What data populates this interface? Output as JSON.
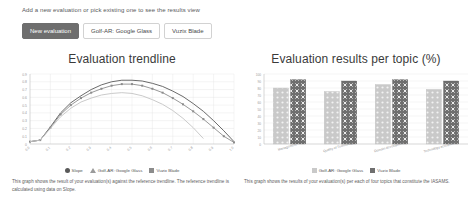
{
  "header": {
    "hint": "Add a new evaluation or pick existing one to see the results view",
    "buttons": [
      {
        "label": "New evaluation",
        "state": "active"
      },
      {
        "label": "Golf-AR: Google Glass",
        "state": "default"
      },
      {
        "label": "Vuzix Blade",
        "state": "default"
      }
    ]
  },
  "colors": {
    "slope": "#595959",
    "golf_ar": "#8c8c8c",
    "vuzix": "#c4c4c4",
    "bar_light": "#c9c9c9",
    "bar_dark": "#6f6f6f",
    "active_button": "#6e6e6e",
    "grid": "#e4e4e4",
    "axis": "#bdbdbd"
  },
  "left_panel": {
    "legend": [
      {
        "label": "Slope",
        "marker": "circle",
        "color": "#595959"
      },
      {
        "label": "Golf-AR: Google Glass",
        "marker": "triangle",
        "color": "#9b9b9b"
      },
      {
        "label": "Vuzix Blade",
        "marker": "square",
        "color": "#8c8c8c"
      }
    ],
    "caption": "This graph shows the result of your evaluation(s) against the reference trendline. The reference trendline is calculated using data on Slope."
  },
  "right_panel": {
    "legend": [
      {
        "label": "Golf-AR: Google Glass",
        "pattern": "dots",
        "color": "#c9c9c9"
      },
      {
        "label": "Vuzix Blade",
        "pattern": "crosses",
        "color": "#6f6f6f"
      }
    ],
    "caption": "This graph shows the results of your evaluation(s) per each of four topics that constitute the IASAMS."
  },
  "chart_data": [
    {
      "type": "line",
      "title": "Evaluation trendline",
      "xlabel": "",
      "ylabel": "",
      "xlim": [
        0,
        1.0
      ],
      "ylim": [
        0,
        0.9
      ],
      "grid": true,
      "legend_position": "bottom",
      "xticks": [
        "0.0",
        "0.1",
        "0.2",
        "0.3",
        "0.4",
        "0.5",
        "0.6",
        "0.7",
        "0.8",
        "0.9",
        "1.0"
      ],
      "yticks": [
        "0",
        "0.1",
        "0.2",
        "0.3",
        "0.4",
        "0.5",
        "0.6",
        "0.7",
        "0.8",
        "0.9"
      ],
      "x": [
        0.0,
        0.05,
        0.1,
        0.15,
        0.2,
        0.25,
        0.3,
        0.35,
        0.4,
        0.45,
        0.5,
        0.55,
        0.6,
        0.65,
        0.7,
        0.75,
        0.8,
        0.85,
        0.9,
        0.95,
        1.0
      ],
      "series": [
        {
          "name": "Slope",
          "color": "#595959",
          "values": [
            0.03,
            0.05,
            0.22,
            0.4,
            0.53,
            0.62,
            0.7,
            0.76,
            0.8,
            0.82,
            0.82,
            0.81,
            0.78,
            0.74,
            0.68,
            0.61,
            0.52,
            0.42,
            0.3,
            0.17,
            0.03
          ]
        },
        {
          "name": "Golf-AR: Google Glass",
          "color": "#8c8c8c",
          "values": [
            0.03,
            0.05,
            0.21,
            0.38,
            0.5,
            0.59,
            0.66,
            0.71,
            0.75,
            0.77,
            0.77,
            0.75,
            0.71,
            0.66,
            0.59,
            0.51,
            0.42,
            0.32,
            0.21,
            0.1,
            0.02
          ]
        },
        {
          "name": "Vuzix Blade",
          "color": "#c4c4c4",
          "values": [
            0.03,
            0.05,
            0.2,
            0.35,
            0.46,
            0.54,
            0.59,
            0.63,
            0.65,
            0.66,
            0.65,
            0.62,
            0.57,
            0.51,
            0.43,
            0.33,
            0.21,
            0.07,
            null,
            null,
            null
          ]
        }
      ]
    },
    {
      "type": "bar",
      "title": "Evaluation results per topic (%)",
      "xlabel": "",
      "ylabel": "",
      "ylim": [
        0,
        100
      ],
      "grid": true,
      "legend_position": "bottom",
      "yticks": [
        "0",
        "10",
        "20",
        "30",
        "40",
        "50",
        "60",
        "70",
        "80",
        "90",
        "100"
      ],
      "categories": [
        "Management",
        "Quality of Technology",
        "Domain development",
        "Technology acceptance"
      ],
      "series": [
        {
          "name": "Golf-AR: Google Glass",
          "color": "#c9c9c9",
          "values": [
            80,
            75,
            85,
            78
          ]
        },
        {
          "name": "Vuzix Blade",
          "color": "#6f6f6f",
          "values": [
            92,
            90,
            92,
            90
          ]
        }
      ]
    }
  ]
}
